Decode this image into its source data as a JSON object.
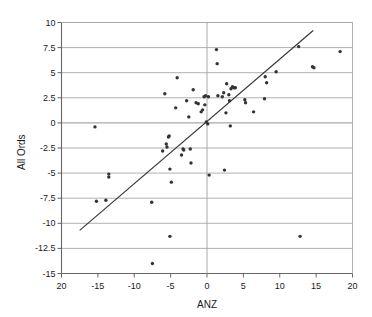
{
  "chart_data": {
    "type": "scatter",
    "title": "",
    "xlabel": "ANZ",
    "ylabel": "All Ords",
    "xlim": [
      -20,
      20
    ],
    "ylim": [
      -15,
      10
    ],
    "grid": "horizontal",
    "legend": "none",
    "xticks": [
      "20",
      "-15",
      "-10",
      "-5",
      "0",
      "5",
      "10",
      "15",
      "20"
    ],
    "xtick_values": [
      -20,
      -15,
      -10,
      -5,
      0,
      5,
      10,
      15,
      20
    ],
    "yticks": [
      "10",
      "7.5",
      "5",
      "2.5",
      "0",
      "-2.5",
      "-5",
      "-7.5",
      "-10",
      "-12.5",
      "-15"
    ],
    "ytick_values": [
      10,
      7.5,
      5,
      2.5,
      0,
      -2.5,
      -5,
      -7.5,
      -10,
      -12.5,
      -15
    ],
    "marker_color": "#333333",
    "line_color": "#333333",
    "grid_color": "#a8a8a8",
    "axis_color": "#666666",
    "points": [
      [
        -15.4,
        -0.4
      ],
      [
        -15.2,
        -7.8
      ],
      [
        -13.9,
        -7.7
      ],
      [
        -13.5,
        -5.1
      ],
      [
        -13.5,
        -5.4
      ],
      [
        -7.6,
        -7.9
      ],
      [
        -7.5,
        -14.0
      ],
      [
        -6.1,
        -2.8
      ],
      [
        -5.8,
        2.9
      ],
      [
        -5.6,
        -2.1
      ],
      [
        -5.5,
        -2.4
      ],
      [
        -5.3,
        -1.4
      ],
      [
        -5.2,
        -1.3
      ],
      [
        -5.1,
        -4.6
      ],
      [
        -5.1,
        -11.3
      ],
      [
        -4.9,
        -5.9
      ],
      [
        -4.3,
        1.5
      ],
      [
        -4.1,
        4.5
      ],
      [
        -3.5,
        -3.2
      ],
      [
        -3.3,
        -2.6
      ],
      [
        -3.2,
        -2.7
      ],
      [
        -2.8,
        2.2
      ],
      [
        -2.5,
        0.6
      ],
      [
        -2.3,
        -2.6
      ],
      [
        -2.2,
        -4.0
      ],
      [
        -1.9,
        3.3
      ],
      [
        -1.5,
        2.0
      ],
      [
        -1.2,
        1.9
      ],
      [
        -0.8,
        1.1
      ],
      [
        -0.6,
        1.3
      ],
      [
        -0.4,
        2.6
      ],
      [
        -0.3,
        1.8
      ],
      [
        -0.2,
        2.7
      ],
      [
        -0.1,
        0.1
      ],
      [
        0.1,
        -0.1
      ],
      [
        0.2,
        2.6
      ],
      [
        0.3,
        -5.2
      ],
      [
        1.3,
        7.3
      ],
      [
        1.4,
        5.9
      ],
      [
        1.5,
        2.7
      ],
      [
        2.1,
        2.6
      ],
      [
        2.3,
        3.0
      ],
      [
        2.4,
        -4.7
      ],
      [
        2.6,
        1.0
      ],
      [
        2.7,
        3.9
      ],
      [
        3.0,
        2.8
      ],
      [
        3.1,
        2.2
      ],
      [
        3.2,
        -0.3
      ],
      [
        3.3,
        3.4
      ],
      [
        3.5,
        3.6
      ],
      [
        3.7,
        3.5
      ],
      [
        3.9,
        3.5
      ],
      [
        5.2,
        2.3
      ],
      [
        5.3,
        2.0
      ],
      [
        6.4,
        1.1
      ],
      [
        7.9,
        2.4
      ],
      [
        8.0,
        4.6
      ],
      [
        8.2,
        4.0
      ],
      [
        9.5,
        5.1
      ],
      [
        12.6,
        7.6
      ],
      [
        12.8,
        -11.3
      ],
      [
        14.5,
        5.6
      ],
      [
        14.7,
        5.5
      ],
      [
        18.3,
        7.1
      ]
    ],
    "trendline": {
      "x_start": -17.5,
      "y_start": -10.7,
      "x_end": 14.6,
      "y_end": 9.2
    }
  }
}
